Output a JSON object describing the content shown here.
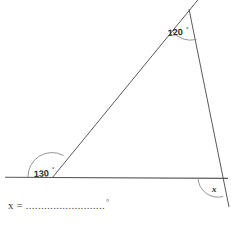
{
  "figure": {
    "type": "geometry-diagram",
    "background_color": "#ffffff",
    "stroke_color": "#595959",
    "arc_color": "#8a8a8a",
    "label_color": "#2b2b2b",
    "points": {
      "apex": {
        "x": 189,
        "y": 9
      },
      "base_left": {
        "x": 52,
        "y": 178
      },
      "base_right": {
        "x": 217,
        "y": 178
      },
      "baseline_start": {
        "x": 5,
        "y": 177
      },
      "baseline_end": {
        "x": 228,
        "y": 178
      },
      "apex_ray_end": {
        "x": 206,
        "y": 0
      },
      "right_ray_end": {
        "x": 228,
        "y": 205
      }
    },
    "angles": [
      {
        "name": "angle-120",
        "value": "120",
        "unit": "°",
        "label": "120°",
        "vertex": "apex",
        "label_x": 168,
        "label_y": 33
      },
      {
        "name": "angle-130",
        "value": "130",
        "unit": "°",
        "label": "130°",
        "vertex": "base_left",
        "label_x": 34,
        "label_y": 175
      },
      {
        "name": "angle-x",
        "value": "x",
        "unit": "",
        "label": "x",
        "vertex": "base_right",
        "label_x": 214,
        "label_y": 190
      }
    ]
  },
  "answer": {
    "variable": "x",
    "equals": "=",
    "dots": "..........................",
    "degree_symbol": "°",
    "full_text": "x = .......................... °"
  }
}
